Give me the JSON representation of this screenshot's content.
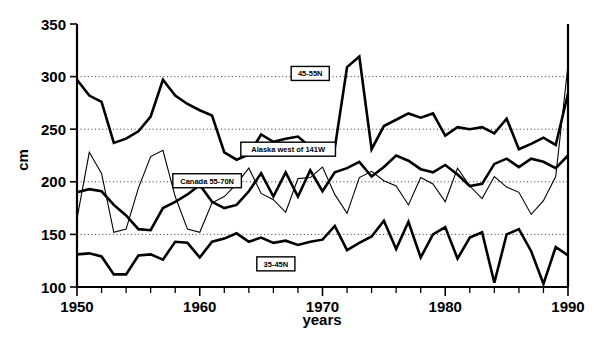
{
  "chart_data": {
    "type": "line",
    "title": "",
    "xlabel": "years",
    "ylabel": "cm",
    "xlim": [
      1950,
      1990
    ],
    "ylim": [
      100,
      350
    ],
    "ytick_values": [
      100,
      150,
      200,
      250,
      300,
      350
    ],
    "ytick_labels": [
      "100",
      "150",
      "200",
      "250",
      "300",
      "350"
    ],
    "xtick_values": [
      1950,
      1960,
      1970,
      1980,
      1990
    ],
    "xtick_labels": [
      "1950",
      "1960",
      "1970",
      "1980",
      "1990"
    ],
    "xtick_minor_step": 2,
    "grid": "horizontal dotted at 150, 200, 250, 300",
    "legend_position": "inline-boxed-labels",
    "x": [
      1950,
      1951,
      1952,
      1953,
      1954,
      1955,
      1956,
      1957,
      1958,
      1959,
      1960,
      1961,
      1962,
      1963,
      1964,
      1965,
      1966,
      1967,
      1968,
      1969,
      1970,
      1971,
      1972,
      1973,
      1974,
      1975,
      1976,
      1977,
      1978,
      1979,
      1980,
      1981,
      1982,
      1983,
      1984,
      1985,
      1986,
      1987,
      1988,
      1989,
      1990
    ],
    "series": [
      {
        "name": "45-55N",
        "label": "45-55N",
        "label_x": 1969.0,
        "label_y": 303,
        "style": "thick",
        "values": [
          297,
          282,
          276,
          237,
          241,
          248,
          262,
          297,
          282,
          274,
          268,
          263,
          228,
          221,
          226,
          245,
          238,
          241,
          243,
          233,
          232,
          232,
          309,
          319,
          231,
          253,
          259,
          265,
          261,
          265,
          244,
          252,
          250,
          252,
          246,
          260,
          231,
          236,
          242,
          235,
          284
        ]
      },
      {
        "name": "Alaska west of 141W",
        "label": "Alaska west of 141W",
        "label_x": 1967.2,
        "label_y": 231,
        "style": "thin",
        "values": [
          165,
          228,
          208,
          152,
          155,
          194,
          224,
          230,
          186,
          155,
          152,
          180,
          186,
          198,
          213,
          189,
          183,
          171,
          203,
          204,
          214,
          188,
          170,
          204,
          210,
          201,
          196,
          178,
          204,
          198,
          181,
          213,
          196,
          184,
          205,
          195,
          190,
          169,
          182,
          205,
          311
        ]
      },
      {
        "name": "Canada 55-70N",
        "label": "Canada 55-70N",
        "label_x": 1960.6,
        "label_y": 201,
        "style": "thick",
        "values": [
          190,
          193,
          191,
          178,
          168,
          155,
          154,
          175,
          181,
          188,
          197,
          181,
          175,
          178,
          191,
          208,
          186,
          209,
          186,
          211,
          191,
          209,
          213,
          219,
          205,
          214,
          225,
          220,
          212,
          209,
          216,
          207,
          196,
          198,
          217,
          222,
          214,
          222,
          219,
          213,
          225
        ]
      },
      {
        "name": "35-45N",
        "label": "35-45N",
        "label_x": 1966.2,
        "label_y": 122,
        "style": "thick",
        "values": [
          131,
          132,
          129,
          112,
          112,
          130,
          131,
          126,
          143,
          142,
          128,
          143,
          146,
          151,
          143,
          147,
          142,
          144,
          140,
          143,
          145,
          158,
          135,
          142,
          148,
          163,
          136,
          162,
          128,
          150,
          157,
          127,
          147,
          152,
          104,
          150,
          155,
          134,
          103,
          138,
          130
        ]
      }
    ]
  },
  "axis": {
    "y_label": "cm",
    "x_label": "years"
  }
}
